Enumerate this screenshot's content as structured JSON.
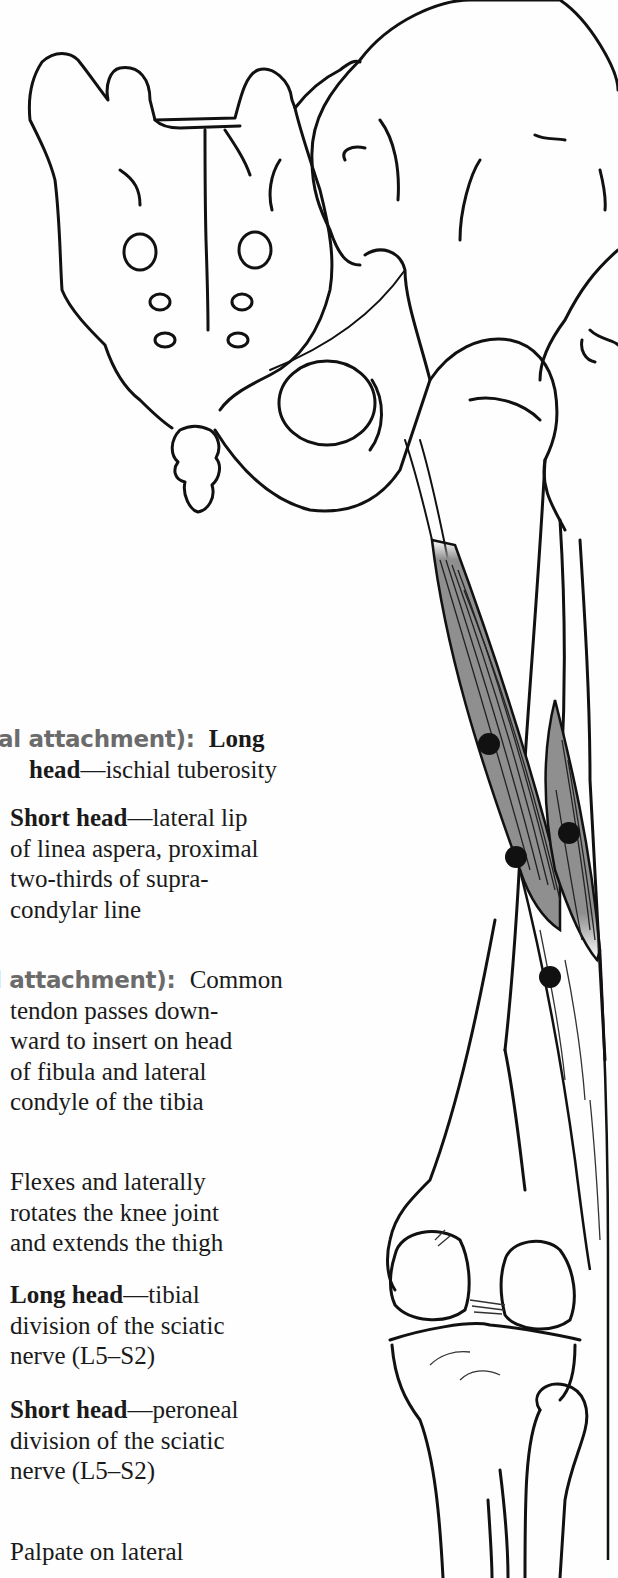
{
  "document": {
    "subject": "Biceps femoris muscle illustration with attachments, action, innervation and palpation",
    "colors": {
      "text": "#1a1a1a",
      "label": "#6b6b6b",
      "muscle_fill": "#8f8f8f",
      "attachment_dot": "#111111",
      "bone_outline": "#111111"
    },
    "entries": {
      "origin": {
        "label_fragment": "al attachment):",
        "long_head_bold_a": "Long",
        "long_head_bold_b": "head",
        "long_head_text": "—ischial tuberosity",
        "short_head_bold": "Short head",
        "short_head_text_1": "—lateral lip",
        "short_head_text_2": "of linea aspera, proximal",
        "short_head_text_3": "two-thirds of supra-",
        "short_head_text_4": "condylar line"
      },
      "insertion": {
        "label_fragment": "l attachment):",
        "text_1": "Common",
        "text_2": "tendon passes down-",
        "text_3": "ward to insert on head",
        "text_4": "of fibula and lateral",
        "text_5": "condyle of the tibia"
      },
      "action": {
        "text_1": "Flexes and laterally",
        "text_2": "rotates the knee joint",
        "text_3": "and extends the thigh"
      },
      "innervation": {
        "long_head_bold": "Long head",
        "long_head_text_1": "—tibial",
        "long_head_text_2": "division of the sciatic",
        "long_head_text_3": "nerve (L5–S2)",
        "short_head_bold": "Short head",
        "short_head_text_1": "—peroneal",
        "short_head_text_2": "division of the sciatic",
        "short_head_text_3": "nerve (L5–S2)"
      },
      "palpation": {
        "text_1": "Palpate on lateral"
      }
    },
    "illustration": {
      "structures": [
        "sacrum",
        "coccyx",
        "ilium",
        "obturator-foramen",
        "femur",
        "biceps-femoris-long-head",
        "biceps-femoris-short-head",
        "knee-joint",
        "tibia",
        "fibula"
      ],
      "attachment_dots": 4
    }
  }
}
